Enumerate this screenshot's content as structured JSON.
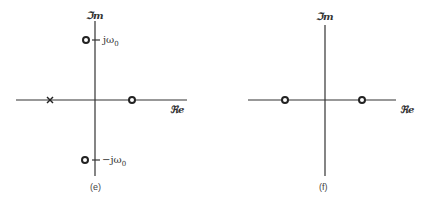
{
  "panels": [
    {
      "id": "e",
      "caption": "(e)",
      "imag_axis_label": "ℑm",
      "real_axis_label": "ℜe",
      "markers": [
        {
          "type": "zero",
          "symbol": "o",
          "position": "j axis upper",
          "label": "jω",
          "label_sub": "0"
        },
        {
          "type": "pole",
          "symbol": "x",
          "position": "negative real axis"
        },
        {
          "type": "zero",
          "symbol": "o",
          "position": "positive real axis"
        },
        {
          "type": "zero",
          "symbol": "o",
          "position": "j axis lower",
          "label": "−jω",
          "label_sub": "0"
        }
      ]
    },
    {
      "id": "f",
      "caption": "(f)",
      "imag_axis_label": "ℑm",
      "real_axis_label": "ℜe",
      "markers": [
        {
          "type": "zero",
          "symbol": "o",
          "position": "negative real axis"
        },
        {
          "type": "zero",
          "symbol": "o",
          "position": "positive real axis"
        }
      ]
    }
  ],
  "colors": {
    "line": "#333333",
    "background": "#ffffff"
  }
}
